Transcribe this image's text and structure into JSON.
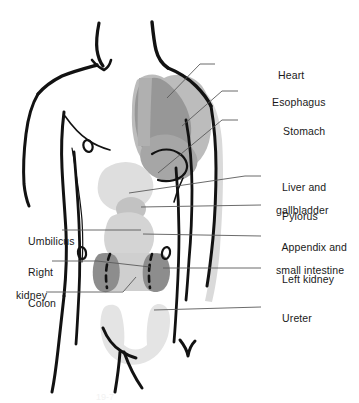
{
  "figure": {
    "type": "anatomical-diagram",
    "view": "anterior",
    "background_color": "#ffffff",
    "outline_color": "#111111",
    "leader_line_color": "#555555",
    "organ_tones": {
      "heart": "#9a9a9a",
      "lung_esophagus": "#b8b8b8",
      "stomach": "#a8a8a8",
      "liver": "#dcdcdc",
      "intestine": "#d2d2d2",
      "kidney": "#8e8e8e",
      "colon": "#c8c8c8",
      "bladder_ureter": "#e2e2e2",
      "arm_shadow": "#d8d8d8"
    }
  },
  "labels": {
    "right": [
      {
        "id": "heart",
        "line1": "Heart",
        "line2": ""
      },
      {
        "id": "esophagus",
        "line1": "Esophagus",
        "line2": ""
      },
      {
        "id": "stomach",
        "line1": "Stomach",
        "line2": ""
      },
      {
        "id": "liver-gallbladder",
        "line1": "Liver and",
        "line2": "gallbladder"
      },
      {
        "id": "pylorus",
        "line1": "Pylorus",
        "line2": ""
      },
      {
        "id": "appendix-small-intestine",
        "line1": "Appendix and",
        "line2": "small intestine"
      },
      {
        "id": "left-kidney",
        "line1": "Left kidney",
        "line2": ""
      },
      {
        "id": "ureter",
        "line1": "Ureter",
        "line2": ""
      }
    ],
    "left": [
      {
        "id": "umbilicus",
        "line1": "Umbilicus",
        "line2": ""
      },
      {
        "id": "right-kidney",
        "line1": "Right",
        "line2": "kidney"
      },
      {
        "id": "colon",
        "line1": "Colon",
        "line2": ""
      }
    ]
  },
  "caption": {
    "text": "19-7"
  }
}
